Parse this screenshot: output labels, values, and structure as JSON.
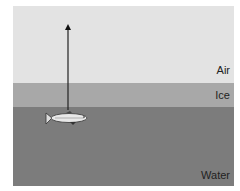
{
  "diagram": {
    "layers": [
      {
        "name": "Air",
        "color": "#e3e3e3"
      },
      {
        "name": "Ice",
        "color": "#a8a8a8"
      },
      {
        "name": "Water",
        "color": "#7c7c7c"
      }
    ],
    "labels": {
      "air": "Air",
      "ice": "Ice",
      "water": "Water"
    },
    "objects": [
      {
        "type": "fish",
        "position": "just below ice"
      },
      {
        "type": "arrow",
        "direction": "up",
        "origin": "fish"
      }
    ]
  }
}
